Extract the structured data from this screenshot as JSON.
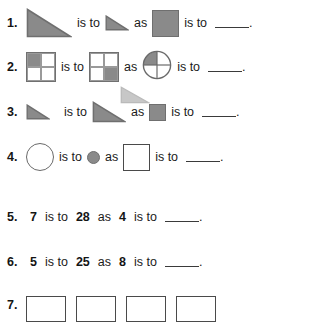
{
  "worksheet": {
    "connector_is_to": "is to",
    "connector_as": "as",
    "period": ".",
    "colors": {
      "shape_fill": "#8a8a8a",
      "shape_stroke": "#6f6f6f",
      "text": "#1b1b1b",
      "background": "#ffffff"
    },
    "items": [
      {
        "number": "1.",
        "type": "shape",
        "a": "large-shaded-triangle",
        "b": "small-shaded-triangle",
        "c": "large-shaded-square",
        "d": "blank"
      },
      {
        "number": "2.",
        "type": "shape",
        "a": "square-top-left-quarter-shaded",
        "b": "square-bottom-right-quarter-shaded",
        "c": "circle-top-left-quarter-shaded",
        "d": "blank"
      },
      {
        "number": "3.",
        "type": "shape",
        "a": "small-shaded-triangle",
        "b": "large-shaded-triangle",
        "c": "small-shaded-square",
        "d": "blank"
      },
      {
        "number": "4.",
        "type": "shape",
        "a": "large-open-circle",
        "b": "small-shaded-circle",
        "c": "large-open-square",
        "d": "blank"
      },
      {
        "number": "5.",
        "type": "number",
        "a": "7",
        "b": "28",
        "c": "4",
        "d": "blank"
      },
      {
        "number": "6.",
        "type": "number",
        "a": "5",
        "b": "25",
        "c": "8",
        "d": "blank"
      },
      {
        "number": "7.",
        "type": "boxes",
        "box_count": 4,
        "note": "row clipped at bottom edge of page"
      }
    ]
  }
}
